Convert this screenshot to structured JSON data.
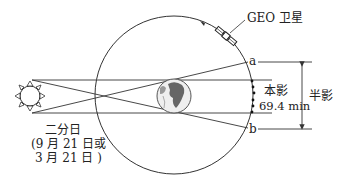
{
  "labels": {
    "satellite": "GEO 卫星",
    "point_a": "a",
    "point_b": "b",
    "umbra": "本影",
    "umbra_duration": "69.4 min",
    "penumbra": "半影",
    "equinox_line1": "二分日",
    "equinox_line2": "(9 月 21 日或",
    "equinox_line3": "3 月 21 日 )"
  },
  "colors": {
    "line": "#333333",
    "earth_ocean": "#e8e8e8",
    "earth_land": "#555555"
  }
}
